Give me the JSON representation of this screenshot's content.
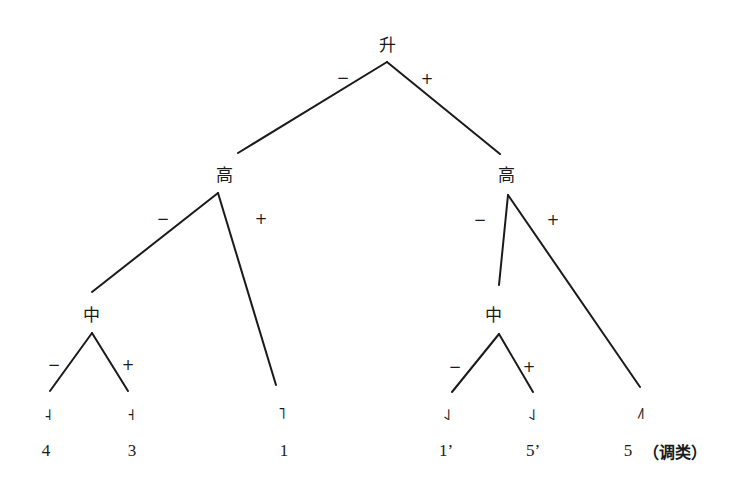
{
  "diagram": {
    "type": "binary-feature-tree",
    "root": {
      "label": "升"
    },
    "level2": {
      "left": {
        "label": "高"
      },
      "right": {
        "label": "高"
      }
    },
    "level3": {
      "left": {
        "label": "中"
      },
      "right": {
        "label": "中"
      }
    },
    "branch_signs": {
      "minus": "−",
      "plus": "+"
    },
    "leaves": [
      {
        "tone_glyph": "˨",
        "value": "4"
      },
      {
        "tone_glyph": "˧",
        "value": "3"
      },
      {
        "tone_glyph": "˥",
        "value": "1"
      },
      {
        "tone_glyph": "˨˩",
        "value": "1’"
      },
      {
        "tone_glyph": "˨˩",
        "value": "5’"
      },
      {
        "tone_glyph": "˩˥",
        "value": "5"
      }
    ],
    "category_label": "（调类）",
    "line_color": "#1a1a1a"
  }
}
